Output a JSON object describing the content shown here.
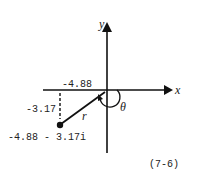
{
  "diagram": {
    "type": "complex-plane-polar-form",
    "axes": {
      "x_label": "x",
      "y_label": "y"
    },
    "point": {
      "label": "-4.88 - 3.17i",
      "real_part_label": "-4.88",
      "imag_part_label": "-3.17"
    },
    "vector_label": "r",
    "angle_label": "θ",
    "caption": "(7-6)"
  },
  "colors": {
    "ink": "#111111",
    "background": "#ffffff"
  }
}
